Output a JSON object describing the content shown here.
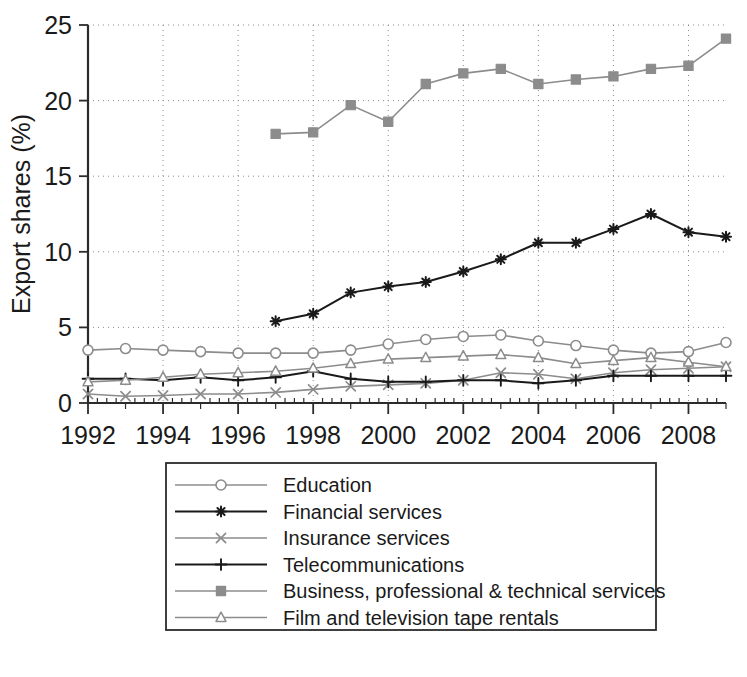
{
  "chart_data": {
    "type": "line",
    "title": "",
    "xlabel": "",
    "ylabel": "Export shares (%)",
    "xlim": [
      1992,
      2009
    ],
    "ylim": [
      0,
      25
    ],
    "yticks": [
      "0",
      "5",
      "10",
      "15",
      "20",
      "25"
    ],
    "ytick_values": [
      0,
      5,
      10,
      15,
      20,
      25
    ],
    "xticks": [
      "1992",
      "1994",
      "1996",
      "1998",
      "2000",
      "2002",
      "2004",
      "2006",
      "2008"
    ],
    "xtick_values": [
      1992,
      1994,
      1996,
      1998,
      2000,
      2002,
      2004,
      2006,
      2008
    ],
    "x": [
      1992,
      1993,
      1994,
      1995,
      1996,
      1997,
      1998,
      1999,
      2000,
      2001,
      2002,
      2003,
      2004,
      2005,
      2006,
      2007,
      2008,
      2009
    ],
    "grid": true,
    "legend_position": "below-plot",
    "series": [
      {
        "name": "Education",
        "marker": "open-circle",
        "color": "#8c8c8c",
        "x": [
          1992,
          1993,
          1994,
          1995,
          1996,
          1997,
          1998,
          1999,
          2000,
          2001,
          2002,
          2003,
          2004,
          2005,
          2006,
          2007,
          2008,
          2009
        ],
        "values": [
          3.5,
          3.6,
          3.5,
          3.4,
          3.3,
          3.3,
          3.3,
          3.5,
          3.9,
          4.2,
          4.4,
          4.5,
          4.1,
          3.8,
          3.5,
          3.3,
          3.4,
          4.0
        ]
      },
      {
        "name": "Financial services",
        "marker": "asterisk",
        "color": "#1a1a1a",
        "x": [
          1997,
          1998,
          1999,
          2000,
          2001,
          2002,
          2003,
          2004,
          2005,
          2006,
          2007,
          2008,
          2009
        ],
        "values": [
          5.4,
          5.9,
          7.3,
          7.7,
          8.0,
          8.7,
          9.5,
          10.6,
          10.6,
          11.5,
          12.5,
          11.3,
          11.0
        ]
      },
      {
        "name": "Insurance services",
        "marker": "cross-x",
        "color": "#8c8c8c",
        "x": [
          1992,
          1993,
          1994,
          1995,
          1996,
          1997,
          1998,
          1999,
          2000,
          2001,
          2002,
          2003,
          2004,
          2005,
          2006,
          2007,
          2008,
          2009
        ],
        "values": [
          0.6,
          0.45,
          0.5,
          0.6,
          0.6,
          0.7,
          0.9,
          1.1,
          1.2,
          1.3,
          1.5,
          2.0,
          1.9,
          1.6,
          2.0,
          2.2,
          2.3,
          2.4
        ]
      },
      {
        "name": "Telecommunications",
        "marker": "plus",
        "color": "#1a1a1a",
        "x": [
          1992,
          1993,
          1994,
          1995,
          1996,
          1997,
          1998,
          1999,
          2000,
          2001,
          2002,
          2003,
          2004,
          2005,
          2006,
          2007,
          2008,
          2009
        ],
        "values": [
          1.6,
          1.6,
          1.5,
          1.7,
          1.5,
          1.7,
          2.1,
          1.6,
          1.4,
          1.4,
          1.5,
          1.5,
          1.3,
          1.5,
          1.8,
          1.8,
          1.8,
          1.8
        ]
      },
      {
        "name": "Business, professional & technical services",
        "marker": "filled-square",
        "color": "#8c8c8c",
        "x": [
          1997,
          1998,
          1999,
          2000,
          2001,
          2002,
          2003,
          2004,
          2005,
          2006,
          2007,
          2008,
          2009
        ],
        "values": [
          17.8,
          17.9,
          19.7,
          18.6,
          21.1,
          21.8,
          22.1,
          21.1,
          21.4,
          21.6,
          22.1,
          22.3,
          24.1
        ]
      },
      {
        "name": "Film and television tape rentals",
        "marker": "open-triangle",
        "color": "#8c8c8c",
        "x": [
          1992,
          1993,
          1994,
          1995,
          1996,
          1997,
          1998,
          1999,
          2000,
          2001,
          2002,
          2003,
          2004,
          2005,
          2006,
          2007,
          2008,
          2009
        ],
        "values": [
          1.4,
          1.5,
          1.7,
          1.9,
          2.0,
          2.1,
          2.3,
          2.6,
          2.9,
          3.0,
          3.1,
          3.2,
          3.0,
          2.6,
          2.8,
          3.0,
          2.7,
          2.4
        ]
      }
    ]
  },
  "legend": {
    "items": [
      {
        "label": "Education"
      },
      {
        "label": "Financial services"
      },
      {
        "label": "Insurance services"
      },
      {
        "label": "Telecommunications"
      },
      {
        "label": "Business, professional & technical services"
      },
      {
        "label": "Film and television tape rentals"
      }
    ]
  }
}
